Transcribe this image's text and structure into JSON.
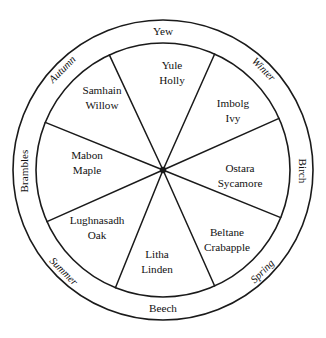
{
  "diagram": {
    "type": "wheel-of-the-year",
    "title": "",
    "geometry": {
      "center_x": 163,
      "center_y": 170,
      "outer_radius": 150,
      "inner_radius": 127,
      "segment_count": 8,
      "stroke_color": "#1a1a1a",
      "background_color": "#ffffff"
    },
    "segments": [
      {
        "festival": "Yule",
        "tree": "Holly",
        "label_x": 172,
        "label_y": 73,
        "start_angle": -66,
        "end_angle": -24
      },
      {
        "festival": "Imbolg",
        "tree": "Ivy",
        "label_x": 233,
        "label_y": 111,
        "start_angle": -24,
        "end_angle": 22
      },
      {
        "festival": "Ostara",
        "tree": "Sycamore",
        "label_x": 240,
        "label_y": 176,
        "start_angle": 22,
        "end_angle": 66
      },
      {
        "festival": "Beltane",
        "tree": "Crabapple",
        "label_x": 227,
        "label_y": 240,
        "start_angle": 66,
        "end_angle": 112
      },
      {
        "festival": "Litha",
        "tree": "Linden",
        "label_x": 157,
        "label_y": 262,
        "start_angle": 112,
        "end_angle": 156
      },
      {
        "festival": "Lughnasadh",
        "tree": "Oak",
        "label_x": 97,
        "label_y": 228,
        "start_angle": 156,
        "end_angle": 202
      },
      {
        "festival": "Mabon",
        "tree": "Maple",
        "label_x": 87,
        "label_y": 163,
        "start_angle": 202,
        "end_angle": 245
      },
      {
        "festival": "Samhain",
        "tree": "Willow",
        "label_x": 102,
        "label_y": 98,
        "start_angle": 245,
        "end_angle": 294
      }
    ],
    "ring_labels": {
      "cardinal_trees": [
        {
          "text": "Yew",
          "position": "top",
          "x": 163,
          "y": 32,
          "rotation": 0
        },
        {
          "text": "Birch",
          "position": "right",
          "x": 302,
          "y": 171,
          "rotation": 90
        },
        {
          "text": "Beech",
          "position": "bottom",
          "x": 163,
          "y": 309,
          "rotation": 0
        },
        {
          "text": "Brambles",
          "position": "left",
          "x": 25,
          "y": 171,
          "rotation": -90
        }
      ],
      "seasons": [
        {
          "text": "Winter",
          "position": "upper-right",
          "x": 263,
          "y": 70,
          "rotation": 45
        },
        {
          "text": "Spring",
          "position": "lower-right",
          "x": 263,
          "y": 272,
          "rotation": -45
        },
        {
          "text": "Summer",
          "position": "lower-left",
          "x": 63,
          "y": 272,
          "rotation": 45
        },
        {
          "text": "Autumn",
          "position": "upper-left",
          "x": 63,
          "y": 70,
          "rotation": -45
        }
      ]
    }
  }
}
